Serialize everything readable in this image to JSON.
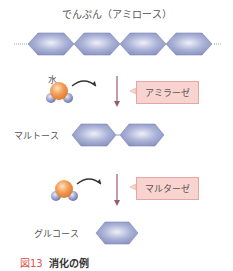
{
  "diagram": {
    "title": "でんぷん（アミロース）",
    "water_label": "水",
    "step1": {
      "enzyme": "アミラーゼ",
      "product": "マルトース"
    },
    "step2": {
      "enzyme": "マルターゼ",
      "product": "グルコース"
    },
    "caption": {
      "number": "図13",
      "text": "消化の例"
    },
    "colors": {
      "hexagon_fill": "#9aa3cc",
      "hexagon_highlight": "#e6e9f6",
      "hexagon_stroke": "#7e88b8",
      "arrow": "#9a5a70",
      "enzyme_fill": "#f9d3d0",
      "enzyme_border": "#e8a6a2",
      "oxygen": "#f0924a",
      "hydrogen": "#8e96c4",
      "caption_accent": "#d9534f"
    }
  }
}
